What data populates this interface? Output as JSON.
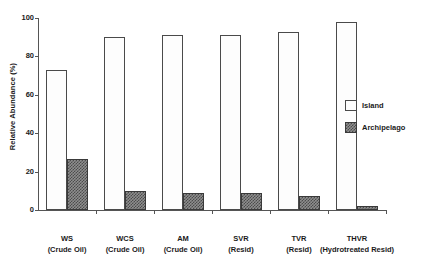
{
  "chart_data": {
    "type": "bar",
    "title": "",
    "xlabel": "",
    "ylabel": "Relative Abundance (%)",
    "ylim": [
      0,
      100
    ],
    "yticks": [
      0,
      20,
      40,
      60,
      80,
      100
    ],
    "ytick_labels": [
      "0",
      "20",
      "40",
      "60",
      "80",
      "100"
    ],
    "grid": false,
    "legend_position": "right",
    "categories": [
      {
        "line1": "WS",
        "line2": "(Crude Oil)"
      },
      {
        "line1": "WCS",
        "line2": "(Crude Oil)"
      },
      {
        "line1": "AM",
        "line2": "(Crude Oil)"
      },
      {
        "line1": "SVR",
        "line2": "(Resid)"
      },
      {
        "line1": "TVR",
        "line2": "(Resid)"
      },
      {
        "line1": "THVR",
        "line2": "(Hydrotreated Resid)"
      }
    ],
    "series": [
      {
        "name": "Island",
        "color": "#fdfdfd",
        "values": [
          73,
          90,
          91,
          91,
          92.5,
          98
        ]
      },
      {
        "name": "Archipelago",
        "color": "#8e8e8e",
        "values": [
          26.5,
          10,
          9,
          9,
          7.5,
          2
        ]
      }
    ]
  },
  "legend": {
    "items": [
      {
        "label": "Island"
      },
      {
        "label": "Archipelago"
      }
    ]
  }
}
